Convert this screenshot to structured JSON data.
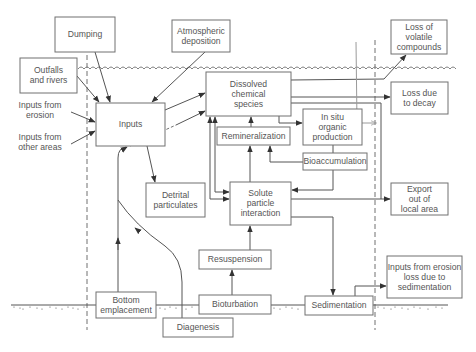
{
  "diagram": {
    "colors": {
      "line": "#555555",
      "box_border": "#707070",
      "text": "#555555",
      "background": "#ffffff"
    },
    "boxes": {
      "dumping": {
        "lines": [
          "Dumping"
        ]
      },
      "atmospheric_deposition": {
        "lines": [
          "Atmospheric",
          "deposition"
        ]
      },
      "outfalls_rivers": {
        "lines": [
          "Outfalls",
          "and rivers"
        ]
      },
      "inputs": {
        "lines": [
          "Inputs"
        ]
      },
      "dissolved": {
        "lines": [
          "Dissolved",
          "chemical",
          "species"
        ]
      },
      "loss_volatile": {
        "lines": [
          "Loss of",
          "volatile",
          "compounds"
        ]
      },
      "loss_decay": {
        "lines": [
          "Loss due",
          "to decay"
        ]
      },
      "in_situ": {
        "lines": [
          "In situ",
          "organic",
          "production"
        ]
      },
      "remineralization": {
        "lines": [
          "Remineralization"
        ]
      },
      "bioaccumulation": {
        "lines": [
          "Bioaccumulation"
        ]
      },
      "detrital": {
        "lines": [
          "Detrital",
          "particulates"
        ]
      },
      "solute_particle": {
        "lines": [
          "Solute",
          "particle",
          "interaction"
        ]
      },
      "export": {
        "lines": [
          "Export",
          "out of",
          "local area"
        ]
      },
      "resuspension": {
        "lines": [
          "Resuspension"
        ]
      },
      "erosion_sedimentation": {
        "lines": [
          "Inputs from erosion",
          "loss due to",
          "sedimentation"
        ]
      },
      "bottom_emplacement": {
        "lines": [
          "Bottom",
          "emplacement"
        ]
      },
      "bioturbation": {
        "lines": [
          "Bioturbation"
        ]
      },
      "sedimentation": {
        "lines": [
          "Sedimentation"
        ]
      },
      "diagenesis": {
        "lines": [
          "Diagenesis"
        ]
      }
    },
    "free_labels": {
      "inputs_erosion": {
        "lines": [
          "Inputs from",
          "erosion"
        ]
      },
      "inputs_other": {
        "lines": [
          "Inputs from",
          "other areas"
        ]
      }
    }
  }
}
